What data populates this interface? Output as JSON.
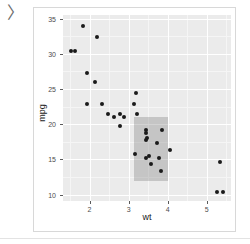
{
  "console": {
    "prompt_symbol": "〉"
  },
  "chart_data": {
    "type": "scatter",
    "title": "",
    "xlabel": "wt",
    "ylabel": "mpg",
    "xlim": [
      1.32,
      5.62
    ],
    "ylim": [
      9.1,
      35.5
    ],
    "xticks": [
      2,
      3,
      4,
      5
    ],
    "xtick_labels": [
      "2",
      "3",
      "4",
      "5"
    ],
    "yticks": [
      10,
      15,
      20,
      25,
      30,
      35
    ],
    "ytick_labels": [
      "10",
      "15",
      "20",
      "25",
      "30",
      "35"
    ],
    "grid": true,
    "legend": "none",
    "panel_background": "#ebebeb",
    "gridline_color": "#ffffff",
    "point_color": "#1a1a1a",
    "annotation": {
      "kind": "rect",
      "xmin": 3.15,
      "xmax": 4.0,
      "ymin": 12.0,
      "ymax": 21.0,
      "fill": "#6e6e6e",
      "alpha": 0.3
    },
    "x": [
      2.62,
      2.875,
      2.32,
      3.215,
      3.44,
      3.46,
      3.57,
      3.19,
      3.15,
      3.44,
      3.44,
      4.07,
      3.73,
      3.78,
      5.25,
      5.424,
      5.345,
      2.2,
      1.615,
      1.835,
      1.935,
      2.465,
      3.52,
      3.435,
      3.84,
      3.845,
      1.935,
      2.14,
      1.513,
      3.17,
      2.77,
      2.78
    ],
    "y": [
      21.0,
      21.0,
      22.8,
      21.4,
      18.7,
      18.1,
      14.3,
      24.4,
      22.8,
      19.2,
      17.8,
      16.4,
      17.3,
      15.2,
      10.4,
      10.4,
      14.7,
      32.4,
      30.4,
      33.9,
      22.8,
      21.5,
      15.5,
      15.2,
      13.3,
      19.2,
      27.3,
      26.0,
      30.4,
      15.8,
      19.7,
      21.4
    ]
  }
}
